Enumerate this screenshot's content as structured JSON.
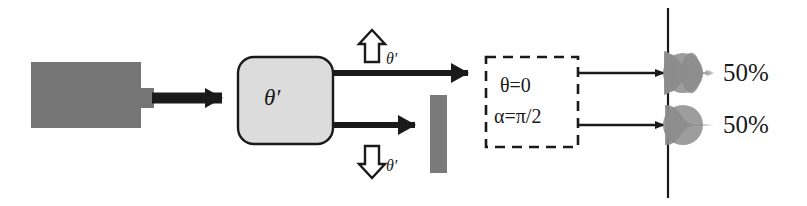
{
  "figure": {
    "name": "stern-gerlach-beam-splitter-diagram",
    "colors": {
      "gray_fill": "#7a7a7a",
      "light_gray_fill": "#dcdcdc",
      "stroke": "#1a1a1a",
      "blob_gray": "#8a8a8a",
      "background": "#ffffff"
    },
    "source": {
      "name": "particle-source",
      "label": ""
    },
    "input_arrow": {
      "name": "input-beam-arrow",
      "label": ""
    },
    "analyzer": {
      "name": "theta-prime-analyzer",
      "label": "θ′"
    },
    "channel_labels": {
      "up": {
        "icon": "hollow-up-arrow-icon",
        "subscript": "θ′"
      },
      "down": {
        "icon": "hollow-down-arrow-icon",
        "subscript": "θ′"
      }
    },
    "blocker": {
      "name": "beam-blocker-bar",
      "label": ""
    },
    "dashed_box": {
      "name": "measurement-settings-box",
      "line1": "θ=0",
      "line2": "α=π/2"
    },
    "screen": {
      "name": "detection-screen-line",
      "label": ""
    },
    "outcomes": [
      {
        "name": "outcome-top",
        "percent": "50%"
      },
      {
        "name": "outcome-bottom",
        "percent": "50%"
      }
    ]
  }
}
